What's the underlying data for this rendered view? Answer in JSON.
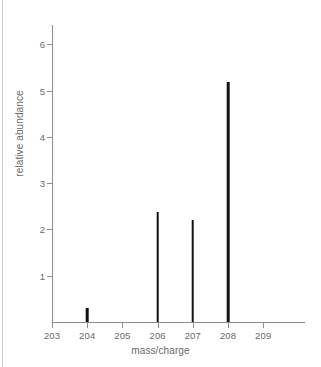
{
  "chart_data": {
    "type": "bar",
    "title": "",
    "subtitle": "",
    "xlabel": "mass/charge",
    "ylabel": "relative abundance",
    "categories": [
      "203",
      "204",
      "205",
      "206",
      "207",
      "208",
      "209"
    ],
    "x": [
      203,
      204,
      205,
      206,
      207,
      208,
      209
    ],
    "values": [
      0,
      0.3,
      0,
      2.38,
      2.2,
      5.18,
      0
    ],
    "series": [
      {
        "name": "relative abundance",
        "points": [
          {
            "x": 203,
            "y": 0
          },
          {
            "x": 204,
            "y": 0.3
          },
          {
            "x": 205,
            "y": 0
          },
          {
            "x": 206,
            "y": 2.38
          },
          {
            "x": 207,
            "y": 2.2
          },
          {
            "x": 208,
            "y": 5.18
          },
          {
            "x": 209,
            "y": 0
          }
        ]
      }
    ],
    "xlim": [
      202.6,
      210.2
    ],
    "ylim": [
      0,
      6.4
    ],
    "xticks": [
      203,
      204,
      205,
      206,
      207,
      208,
      209
    ],
    "xtick_labels": [
      "203",
      "204",
      "205",
      "206",
      "207",
      "208",
      "209"
    ],
    "yticks": [
      1,
      2,
      3,
      4,
      5,
      6
    ],
    "ytick_labels": [
      "1",
      "2",
      "3",
      "4",
      "5",
      "6"
    ],
    "grid": false,
    "legend": false,
    "legend_position": "none",
    "annotations": [],
    "colors": {
      "peak": "#111111",
      "axis": "#8d8d8d",
      "tick_label": "#6a6a6a",
      "axis_title": "#6a6a6a",
      "background": "#ffffff",
      "page_rule": "#cfcfcf"
    }
  }
}
